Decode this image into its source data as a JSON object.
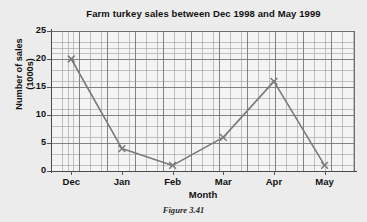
{
  "figure": {
    "caption": "Figure 3.41",
    "background_color": "#ececec",
    "plot_background_color": "#f4f4f4",
    "grid_color": "#9a9a9a",
    "major_grid_color": "#6e6e6e",
    "axis_color": "#4a4a4a",
    "series_color": "#7a7a7a"
  },
  "chart_data": {
    "type": "line",
    "title": "Farm turkey sales between Dec 1998 and May 1999",
    "xlabel": "Month",
    "ylabel_line1": "Number of sales",
    "ylabel_line2": "(1000s)",
    "ylabel": "Number of sales (1000s)",
    "categories": [
      "Dec",
      "Jan",
      "Feb",
      "Mar",
      "Apr",
      "May"
    ],
    "values": [
      20,
      4,
      1,
      6,
      16,
      1
    ],
    "ylim": [
      0,
      25
    ],
    "yticks": [
      0,
      5,
      10,
      15,
      20,
      25
    ],
    "ytick_labels": [
      "0",
      "5",
      "10",
      "15",
      "20",
      "25"
    ],
    "grid": true,
    "minor_grid": true,
    "legend": false,
    "marker": "x",
    "series": [
      {
        "name": "Farm turkey sales",
        "values": [
          20,
          4,
          1,
          6,
          16,
          1
        ]
      }
    ]
  }
}
